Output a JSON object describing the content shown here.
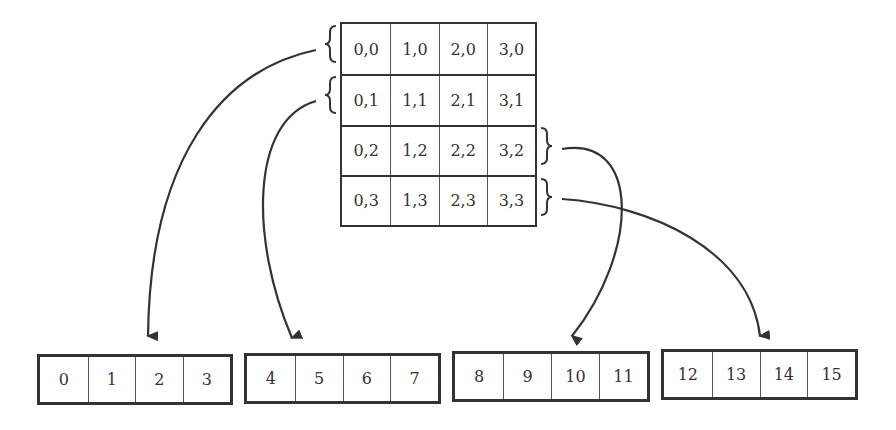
{
  "diagram": {
    "type": "2D array to linear memory mapping",
    "grid": {
      "rows": [
        [
          "0,0",
          "1,0",
          "2,0",
          "3,0"
        ],
        [
          "0,1",
          "1,1",
          "2,1",
          "3,1"
        ],
        [
          "0,2",
          "1,2",
          "2,2",
          "3,2"
        ],
        [
          "0,3",
          "1,3",
          "2,3",
          "3,3"
        ]
      ]
    },
    "blocks": [
      {
        "cells": [
          "0",
          "1",
          "2",
          "3"
        ]
      },
      {
        "cells": [
          "4",
          "5",
          "6",
          "7"
        ]
      },
      {
        "cells": [
          "8",
          "9",
          "10",
          "11"
        ]
      },
      {
        "cells": [
          "12",
          "13",
          "14",
          "15"
        ]
      }
    ],
    "arrows": [
      {
        "from_row": 0,
        "to_block": 0
      },
      {
        "from_row": 1,
        "to_block": 1
      },
      {
        "from_row": 2,
        "to_block": 2
      },
      {
        "from_row": 3,
        "to_block": 3
      }
    ],
    "colors": {
      "stroke": "#333333",
      "background": "#ffffff"
    }
  }
}
